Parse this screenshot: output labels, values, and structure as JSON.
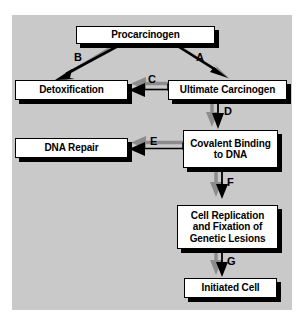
{
  "diagram": {
    "canvas_color": "#c9c9c9",
    "page_color": "#ffffff",
    "node_fill": "#ffffff",
    "node_stroke": "#000000",
    "shadow_color": "#000000",
    "arrow_color": "#000000",
    "arrow_shadow_color": "#8c8c8c",
    "nodes": [
      {
        "id": "procarcinogen",
        "label": "Procarcinogen"
      },
      {
        "id": "detoxification",
        "label": "Detoxification"
      },
      {
        "id": "ultimate-carcinogen",
        "label": "Ultimate Carcinogen"
      },
      {
        "id": "dna-repair",
        "label": "DNA Repair"
      },
      {
        "id": "covalent-binding",
        "label": "Covalent Binding\nto DNA"
      },
      {
        "id": "cell-replication",
        "label": "Cell Replication\nand Fixation of\nGenetic Lesions"
      },
      {
        "id": "initiated-cell",
        "label": "Initiated Cell"
      }
    ],
    "edges": [
      {
        "id": "a",
        "label": "A",
        "from": "procarcinogen",
        "to": "ultimate-carcinogen",
        "direction": "down-right"
      },
      {
        "id": "b",
        "label": "B",
        "from": "procarcinogen",
        "to": "detoxification",
        "direction": "down-left"
      },
      {
        "id": "c",
        "label": "C",
        "from": "ultimate-carcinogen",
        "to": "detoxification",
        "direction": "left"
      },
      {
        "id": "d",
        "label": "D",
        "from": "ultimate-carcinogen",
        "to": "covalent-binding",
        "direction": "down"
      },
      {
        "id": "e",
        "label": "E",
        "from": "covalent-binding",
        "to": "dna-repair",
        "direction": "left"
      },
      {
        "id": "f",
        "label": "F",
        "from": "covalent-binding",
        "to": "cell-replication",
        "direction": "down"
      },
      {
        "id": "g",
        "label": "G",
        "from": "cell-replication",
        "to": "initiated-cell",
        "direction": "down"
      }
    ]
  }
}
